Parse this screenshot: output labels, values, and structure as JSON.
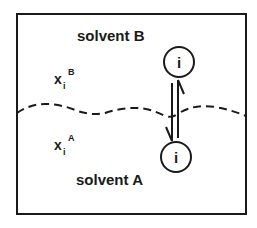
{
  "diagram": {
    "title": "",
    "phases": {
      "upper": {
        "label": "solvent B"
      },
      "lower": {
        "label": "solvent A"
      }
    },
    "mole_fractions": {
      "upper": {
        "base": "x",
        "subscript": "i",
        "superscript": "B"
      },
      "lower": {
        "base": "x",
        "subscript": "i",
        "superscript": "A"
      }
    },
    "species": {
      "upper": {
        "label": "i"
      },
      "lower": {
        "label": "i"
      }
    },
    "interface": {
      "style": "dashed wavy line"
    },
    "equilibrium": {
      "symbol": "double half-arrow (equilibrium)"
    },
    "colors": {
      "line": "#1a1a1a",
      "background": "#ffffff"
    }
  }
}
